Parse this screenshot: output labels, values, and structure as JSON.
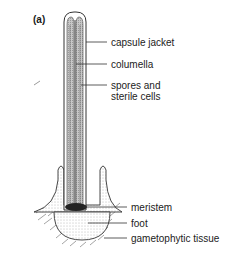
{
  "figure": {
    "panel_label": "(a)",
    "labels": {
      "capsule_jacket": "capsule jacket",
      "columella": "columella",
      "spores_line1": "spores and",
      "spores_line2": "sterile cells",
      "meristem": "meristem",
      "foot": "foot",
      "gametophytic_tissue": "gametophytic tissue"
    }
  }
}
